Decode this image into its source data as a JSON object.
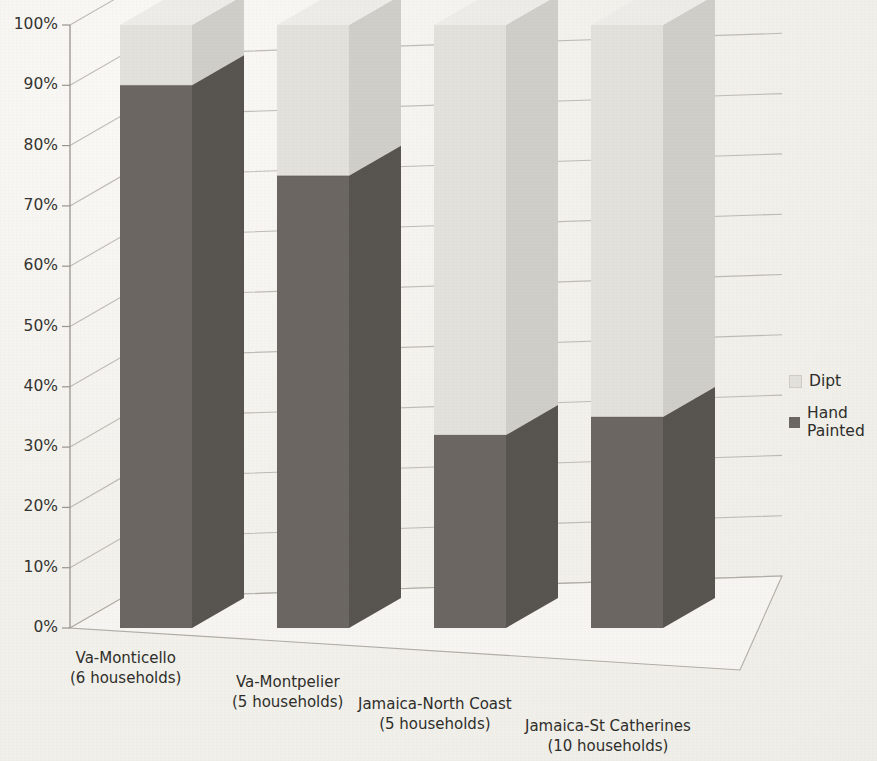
{
  "chart_data": {
    "type": "bar",
    "subtype": "stacked-3d-column",
    "title": "",
    "subtitle": "",
    "xlabel": "",
    "ylabel": "",
    "ylim": [
      0,
      100
    ],
    "y_unit": "%",
    "grid": true,
    "legend_position": "right",
    "categories": [
      "Va-Monticello\n(6 households)",
      "Va-Montpelier\n(5 households)",
      "Jamaica-North Coast\n(5 households)",
      "Jamaica-St Catherines\n(10 households)"
    ],
    "category_lines": [
      [
        "Va-Monticello",
        "(6 households)"
      ],
      [
        "Va-Montpelier",
        "(5 households)"
      ],
      [
        "Jamaica-North Coast",
        "(5 households)"
      ],
      [
        "Jamaica-St Catherines",
        "(10 households)"
      ]
    ],
    "ytick_labels": [
      "0%",
      "10%",
      "20%",
      "30%",
      "40%",
      "50%",
      "60%",
      "70%",
      "80%",
      "90%",
      "100%"
    ],
    "ytick_values": [
      0,
      10,
      20,
      30,
      40,
      50,
      60,
      70,
      80,
      90,
      100
    ],
    "series": [
      {
        "name": "Hand Painted",
        "values": [
          90,
          75,
          32,
          35
        ],
        "color": "#6b6661",
        "color_side": "#57534e",
        "color_top": "#7d7872"
      },
      {
        "name": "Dipt",
        "values": [
          10,
          25,
          68,
          65
        ],
        "color": "#e3e1dc",
        "color_side": "#d0cec9",
        "color_top": "#eeece8"
      }
    ]
  },
  "legend": {
    "items": [
      {
        "label": "Dipt",
        "swatch": "#e3e1dc"
      },
      {
        "label": "Hand Painted",
        "swatch": "#6b6661"
      }
    ]
  },
  "axis": {
    "y_labels": [
      "100%",
      "90%",
      "80%",
      "70%",
      "60%",
      "50%",
      "40%",
      "30%",
      "20%",
      "10%",
      "0%"
    ]
  },
  "colors": {
    "background": "#f2f1ec",
    "axis_line": "#9d9a93",
    "grid_line": "#b3b0a9",
    "text": "#2e2d29"
  }
}
